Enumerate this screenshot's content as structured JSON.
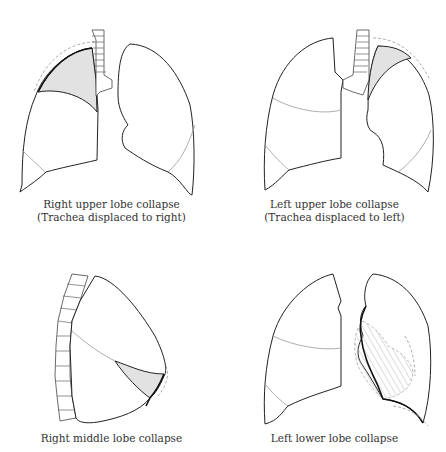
{
  "header": {
    "text": ""
  },
  "panels": [
    {
      "id": "right-upper-lobe-collapse",
      "caption_line1": "Right upper lobe collapse",
      "caption_line2": "(Trachea displaced to right)"
    },
    {
      "id": "left-upper-lobe-collapse",
      "caption_line1": "Left upper lobe collapse",
      "caption_line2": "(Trachea displaced to left)"
    },
    {
      "id": "right-middle-lobe-collapse",
      "caption_line1": "Right middle lobe collapse",
      "caption_line2": ""
    },
    {
      "id": "left-lower-lobe-collapse",
      "caption_line1": "Left lower lobe collapse",
      "caption_line2": ""
    }
  ],
  "colors": {
    "shaded_lobe": "#e2e2e2",
    "outline": "#222222",
    "fissure": "#999999"
  }
}
